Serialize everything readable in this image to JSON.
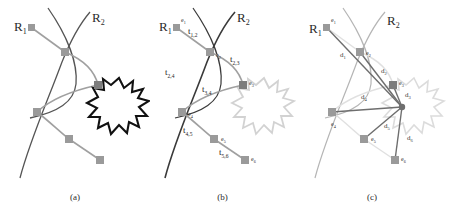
{
  "figure": {
    "panels": [
      {
        "id": "a",
        "caption": "(a)",
        "curve_labels": [
          {
            "name": "R1",
            "base": "R",
            "sub": "1"
          },
          {
            "name": "R2",
            "base": "R",
            "sub": "2"
          }
        ],
        "nodes": [
          {
            "name": "e1",
            "x": 32,
            "y": 28,
            "color": "#9a9a9a"
          },
          {
            "name": "e2",
            "x": 65,
            "y": 52,
            "color": "#9a9a9a"
          },
          {
            "name": "e3",
            "x": 98,
            "y": 85,
            "color": "#7d7d7d"
          },
          {
            "name": "e4",
            "x": 37,
            "y": 112,
            "color": "#9a9a9a"
          },
          {
            "name": "e5",
            "x": 69,
            "y": 139,
            "color": "#9a9a9a"
          },
          {
            "name": "e6",
            "x": 100,
            "y": 160,
            "color": "#9a9a9a"
          }
        ],
        "edge_labels": [],
        "burst": {
          "cx": 119,
          "cy": 104,
          "color": "#111111"
        }
      },
      {
        "id": "b",
        "caption": "(b)",
        "curve_labels": [
          {
            "name": "R1",
            "base": "R",
            "sub": "1"
          },
          {
            "name": "R2",
            "base": "R",
            "sub": "2"
          }
        ],
        "nodes": [
          {
            "name": "e1",
            "x": 32,
            "y": 28,
            "color": "#9a9a9a",
            "label": "e",
            "sub": "1"
          },
          {
            "name": "e2",
            "x": 65,
            "y": 52,
            "color": "#9a9a9a",
            "label": "e",
            "sub": "2"
          },
          {
            "name": "e3",
            "x": 98,
            "y": 85,
            "color": "#7d7d7d",
            "label": "e",
            "sub": "3"
          },
          {
            "name": "e4",
            "x": 37,
            "y": 112,
            "color": "#9a9a9a",
            "label": "e",
            "sub": "4"
          },
          {
            "name": "e5",
            "x": 69,
            "y": 139,
            "color": "#9a9a9a",
            "label": "e",
            "sub": "5"
          },
          {
            "name": "e6",
            "x": 100,
            "y": 160,
            "color": "#9a9a9a",
            "label": "e",
            "sub": "6"
          }
        ],
        "edge_labels": [
          {
            "name": "t12",
            "base": "t",
            "sub": "1,2",
            "x": 43,
            "y": 34
          },
          {
            "name": "t23",
            "base": "t",
            "sub": "2,3",
            "x": 85,
            "y": 62
          },
          {
            "name": "t24",
            "base": "t",
            "sub": "2,4",
            "x": 20,
            "y": 75
          },
          {
            "name": "t34",
            "base": "t",
            "sub": "3,4",
            "x": 57,
            "y": 92
          },
          {
            "name": "t45",
            "base": "t",
            "sub": "4,5",
            "x": 38,
            "y": 133
          },
          {
            "name": "t56",
            "base": "t",
            "sub": "5,6",
            "x": 74,
            "y": 155
          }
        ],
        "burst": {
          "cx": 119,
          "cy": 104,
          "color": "#d2d2d2"
        }
      },
      {
        "id": "c",
        "caption": "(c)",
        "curve_labels": [
          {
            "name": "R1",
            "base": "R",
            "sub": "1"
          },
          {
            "name": "R2",
            "base": "R",
            "sub": "2"
          }
        ],
        "nodes": [
          {
            "name": "e1",
            "x": 32,
            "y": 28,
            "color": "#9a9a9a",
            "label": "e",
            "sub": "1"
          },
          {
            "name": "e2",
            "x": 65,
            "y": 52,
            "color": "#9a9a9a",
            "label": "e",
            "sub": "2"
          },
          {
            "name": "e3",
            "x": 98,
            "y": 85,
            "color": "#7d7d7d",
            "label": "e",
            "sub": "3"
          },
          {
            "name": "e4",
            "x": 37,
            "y": 112,
            "color": "#9a9a9a",
            "label": "e",
            "sub": "4"
          },
          {
            "name": "e5",
            "x": 69,
            "y": 139,
            "color": "#9a9a9a",
            "label": "e",
            "sub": "5"
          },
          {
            "name": "e6",
            "x": 100,
            "y": 160,
            "color": "#9a9a9a",
            "label": "e",
            "sub": "6"
          }
        ],
        "target": {
          "name": "target-point",
          "x": 107,
          "y": 107
        },
        "edge_labels": [
          {
            "name": "d1",
            "base": "d",
            "sub": "1",
            "x": 45,
            "y": 57
          },
          {
            "name": "d2",
            "base": "d",
            "sub": "2",
            "x": 86,
            "y": 73
          },
          {
            "name": "d3",
            "base": "d",
            "sub": "3",
            "x": 110,
            "y": 95
          },
          {
            "name": "d4",
            "base": "d",
            "sub": "4",
            "x": 66,
            "y": 99
          },
          {
            "name": "d5",
            "base": "d",
            "sub": "5",
            "x": 89,
            "y": 128
          },
          {
            "name": "d6",
            "base": "d",
            "sub": "6",
            "x": 112,
            "y": 140
          }
        ],
        "burst": {
          "cx": 119,
          "cy": 104,
          "color": "#dcdcdc"
        }
      }
    ],
    "colors": {
      "path": "#a0a0a0",
      "curve": "#555555",
      "node": "#9a9a9a",
      "node_dark": "#7d7d7d",
      "distance_line": "#6e6e6e",
      "burst_dark": "#111111",
      "burst_light": "#d2d2d2",
      "text": "#2b2b2b",
      "background": "#ffffff"
    }
  }
}
